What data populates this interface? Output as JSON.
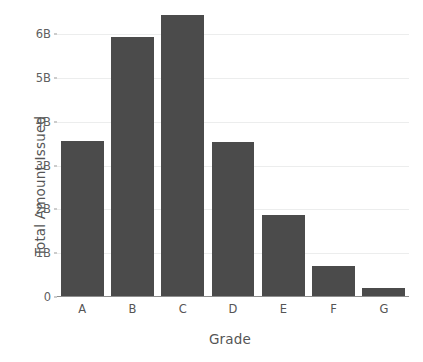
{
  "chart_data": {
    "type": "bar",
    "title": "",
    "xlabel": "Grade",
    "ylabel": "Total Amount Issued",
    "categories": [
      "A",
      "B",
      "C",
      "D",
      "E",
      "F",
      "G"
    ],
    "values": [
      3.57,
      5.93,
      6.43,
      3.55,
      1.88,
      0.7,
      0.2
    ],
    "value_unit": "B",
    "ylim": [
      0,
      6.6
    ],
    "ytick_values": [
      0,
      1,
      2,
      3,
      4,
      5,
      6
    ],
    "ytick_labels": [
      "0",
      "1B",
      "2B",
      "3B",
      "4B",
      "5B",
      "6B"
    ],
    "grid": "horizontal",
    "legend": "none",
    "bar_color": "#4b4b4b",
    "grid_color": "#eceded",
    "axis_color": "#8e8e8e",
    "background_color": "#ffffff",
    "tick_label_color": "#606060",
    "axis_label_color": "#555555"
  }
}
